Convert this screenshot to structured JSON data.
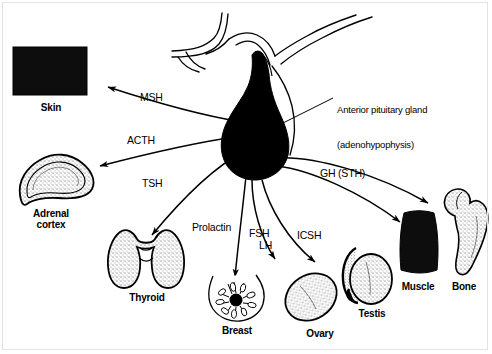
{
  "figure": {
    "type": "anatomical-diagram",
    "background_color": "#ffffff",
    "ink_color": "#000000",
    "frame_color": "#e3e3e3"
  },
  "callouts": [
    {
      "name": "anterior-pituitary-callout",
      "line1": "Anterior pituitary gland",
      "line2": "(adenohypophysis)",
      "x": 337,
      "y": 81
    }
  ],
  "hormones": [
    {
      "id": "msh",
      "label": "MSH",
      "x": 140,
      "y": 92,
      "target": "skin"
    },
    {
      "id": "acth",
      "label": "ACTH",
      "x": 127,
      "y": 135,
      "target": "adrenal-cortex"
    },
    {
      "id": "tsh",
      "label": "TSH",
      "x": 142,
      "y": 178,
      "target": "thyroid"
    },
    {
      "id": "prolactin",
      "label": "Prolactin",
      "x": 192,
      "y": 222,
      "target": "breast"
    },
    {
      "id": "fsh",
      "label": "FSH",
      "x": 249,
      "y": 228,
      "target": "ovary"
    },
    {
      "id": "lh",
      "label": "LH",
      "x": 259,
      "y": 240,
      "target": "ovary"
    },
    {
      "id": "icsh",
      "label": "ICSH",
      "x": 297,
      "y": 230,
      "target": "testis"
    },
    {
      "id": "gh",
      "label": "GH (STH)",
      "x": 320,
      "y": 168,
      "target": "muscle-bone"
    }
  ],
  "organs": [
    {
      "id": "skin",
      "label": "Skin",
      "x": 42,
      "y": 105,
      "shape": "filled-rectangle"
    },
    {
      "id": "adrenal-cortex",
      "label": "Adrenal\ncortex",
      "x": 43,
      "y": 211,
      "shape": "triangular-stippled"
    },
    {
      "id": "thyroid",
      "label": "Thyroid",
      "x": 136,
      "y": 290,
      "shape": "butterfly-lobes"
    },
    {
      "id": "breast",
      "label": "Breast",
      "x": 238,
      "y": 327,
      "shape": "breast-with-ducts"
    },
    {
      "id": "ovary",
      "label": "Ovary",
      "x": 320,
      "y": 333,
      "shape": "oval-stippled"
    },
    {
      "id": "testis",
      "label": "Testis",
      "x": 372,
      "y": 314,
      "shape": "oval-with-epididymis"
    },
    {
      "id": "muscle",
      "label": "Muscle",
      "x": 417,
      "y": 285,
      "shape": "filled-spindle"
    },
    {
      "id": "bone",
      "label": "Bone",
      "x": 457,
      "y": 285,
      "shape": "femur-stippled"
    }
  ],
  "anatomy": {
    "pituitary": {
      "name": "pituitary-gland",
      "fill": "#000000"
    },
    "hypothalamus": {
      "name": "hypothalamus-outline",
      "fill": "none"
    }
  }
}
